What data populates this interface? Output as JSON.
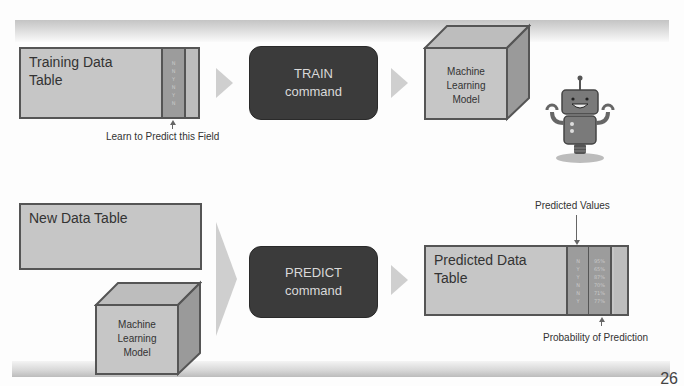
{
  "slide": {
    "page_number": "26"
  },
  "train_row": {
    "training_table": {
      "title_line1": "Training Data",
      "title_line2": "Table",
      "target_column_values": [
        "N",
        "N",
        "Y",
        "N",
        "Y",
        "N"
      ]
    },
    "field_label": "Learn to Predict this Field",
    "train_command": {
      "line1": "TRAIN",
      "line2": "command"
    },
    "model_cube": {
      "line1": "Machine",
      "line2": "Learning",
      "line3": "Model"
    },
    "robot_icon": "robot-icon"
  },
  "predict_row": {
    "new_table": {
      "title": "New Data Table"
    },
    "model_cube": {
      "line1": "Machine",
      "line2": "Learning",
      "line3": "Model"
    },
    "predict_command": {
      "line1": "PREDICT",
      "line2": "command"
    },
    "predicted_table": {
      "title_line1": "Predicted Data",
      "title_line2": "Table",
      "predicted_values": [
        "N",
        "Y",
        "Y",
        "N",
        "N",
        "Y"
      ],
      "probabilities": [
        "95%",
        "65%",
        "87%",
        "70%",
        "71%",
        "77%"
      ]
    },
    "predicted_values_label": "Predicted Values",
    "probability_label": "Probability of Prediction"
  },
  "colors": {
    "command_box": "#3b3b3b",
    "table_fill": "#c6c6c6",
    "column_fill": "#9c9c9c",
    "border": "#555555",
    "chevron": "#cfcfcf"
  }
}
